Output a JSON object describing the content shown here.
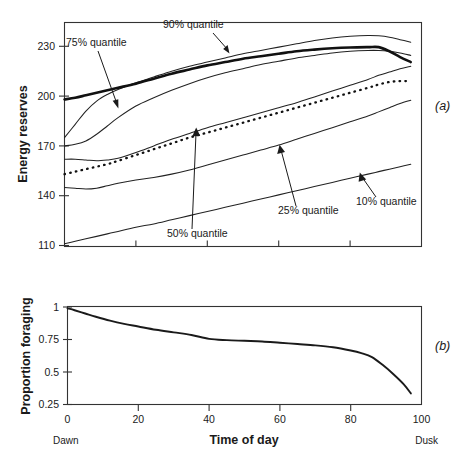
{
  "figure": {
    "panels": [
      {
        "letter": "(a)",
        "name": "energy-reserves-panel"
      },
      {
        "letter": "(b)",
        "name": "proportion-foraging-panel"
      }
    ]
  },
  "panel_a": {
    "ylabel": "Energy reserves",
    "yticks": [
      "230",
      "200",
      "170",
      "140",
      "110"
    ],
    "annotations": [
      {
        "label": "90% quantile"
      },
      {
        "label": "75% quantile"
      },
      {
        "label": "50% quantile"
      },
      {
        "label": "25% quantile"
      },
      {
        "label": "10% quantile"
      }
    ]
  },
  "panel_b": {
    "ylabel": "Proportion foraging",
    "yticks": [
      "1",
      "0.75",
      "0.5",
      "0.25"
    ],
    "xticks": [
      "0",
      "20",
      "40",
      "60",
      "80",
      "100"
    ],
    "xlabel": "Time of day",
    "x_start_label": "Dawn",
    "x_end_label": "Dusk"
  },
  "chart_data": [
    {
      "type": "line",
      "id": "panel-a",
      "title": "",
      "xlabel": "Time of day",
      "ylabel": "Energy reserves",
      "xlim": [
        0,
        100
      ],
      "ylim": [
        110,
        245
      ],
      "yticks": [
        230,
        200,
        170,
        140,
        110
      ],
      "xticks": [
        0,
        20,
        40,
        60,
        80,
        100
      ],
      "grid": false,
      "legend": "annotations-with-arrows",
      "x": [
        0,
        3,
        6,
        9,
        12,
        15,
        20,
        25,
        30,
        35,
        40,
        45,
        50,
        55,
        60,
        65,
        70,
        75,
        80,
        85,
        88,
        91,
        94,
        97
      ],
      "series": [
        {
          "name": "mean (thick solid)",
          "style": "thick-solid",
          "values": [
            198,
            199,
            200.5,
            202,
            203.5,
            205,
            207.5,
            210.5,
            213.5,
            216,
            218.5,
            220.5,
            222.5,
            224,
            225.5,
            227,
            228,
            228.8,
            229.3,
            229.5,
            229.5,
            227,
            223.5,
            220.5
          ]
        },
        {
          "name": "90% quantile",
          "style": "solid",
          "values": [
            175,
            183,
            191,
            197,
            201,
            204,
            208,
            211.5,
            215,
            218,
            220.5,
            223,
            225.5,
            227.5,
            229.5,
            231.5,
            233.5,
            235,
            236,
            236.5,
            236.3,
            235.5,
            234,
            232.5
          ]
        },
        {
          "name": "75% quantile",
          "style": "solid",
          "values": [
            170,
            171,
            173,
            177,
            182,
            187,
            194,
            199,
            203.5,
            207.5,
            211,
            214,
            216.5,
            219,
            221,
            223,
            224.5,
            226,
            227,
            227.5,
            227.5,
            227,
            226,
            224.5
          ]
        },
        {
          "name": "mean reserves (dotted)",
          "style": "dotted",
          "values": [
            153,
            154.5,
            156,
            157.5,
            159,
            161,
            164.5,
            168,
            171.5,
            175,
            178,
            181,
            184,
            187,
            190,
            193,
            196,
            199,
            202,
            205,
            207,
            208.5,
            209,
            209
          ]
        },
        {
          "name": "50% quantile",
          "style": "solid",
          "values": [
            162,
            162,
            161.5,
            161,
            161.5,
            162.5,
            166,
            170,
            174,
            177.5,
            181,
            184,
            187,
            190,
            193,
            196,
            199.5,
            203,
            206.5,
            210,
            212.5,
            214.5,
            216.5,
            218
          ]
        },
        {
          "name": "25% quantile",
          "style": "solid",
          "values": [
            145,
            144.5,
            144,
            144.5,
            146,
            147.5,
            149.5,
            151,
            153,
            155.5,
            158.5,
            161.5,
            164.5,
            167.5,
            170.5,
            174,
            177.5,
            181,
            184.5,
            188,
            190.5,
            193,
            195.5,
            197.5
          ]
        },
        {
          "name": "10% quantile",
          "style": "solid",
          "values": [
            111,
            112.5,
            114,
            115.5,
            117,
            118.5,
            121,
            123,
            125.5,
            128,
            130.5,
            133,
            135.5,
            138,
            140.5,
            143,
            145.5,
            148,
            150.5,
            153,
            154.5,
            156,
            157.5,
            159
          ]
        }
      ]
    },
    {
      "type": "line",
      "id": "panel-b",
      "title": "",
      "xlabel": "Time of day",
      "ylabel": "Proportion foraging",
      "xlim": [
        0,
        100
      ],
      "ylim": [
        0.25,
        1.05
      ],
      "yticks": [
        1,
        0.75,
        0.5,
        0.25
      ],
      "xticks": [
        0,
        20,
        40,
        60,
        80,
        100
      ],
      "grid": false,
      "x": [
        0,
        2,
        5,
        8,
        12,
        16,
        20,
        25,
        30,
        35,
        40,
        45,
        50,
        55,
        60,
        65,
        70,
        75,
        80,
        83,
        86,
        89,
        92,
        95,
        97
      ],
      "series": [
        {
          "name": "proportion foraging",
          "style": "solid",
          "values": [
            0.99,
            0.975,
            0.95,
            0.925,
            0.895,
            0.87,
            0.85,
            0.825,
            0.805,
            0.785,
            0.755,
            0.745,
            0.74,
            0.735,
            0.725,
            0.715,
            0.705,
            0.69,
            0.665,
            0.645,
            0.615,
            0.555,
            0.485,
            0.405,
            0.335
          ]
        }
      ]
    }
  ]
}
